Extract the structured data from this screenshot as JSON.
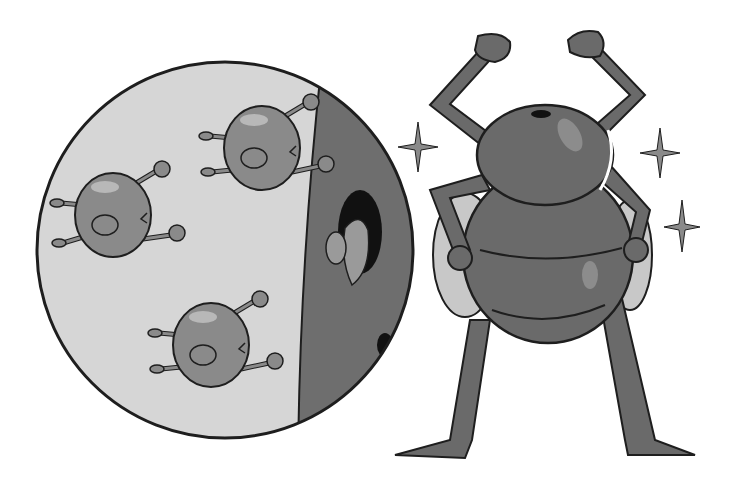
{
  "scene": {
    "description": "Grayscale cartoon illustration: magnified circle showing small germ-like bacteria beside a dark wall with a mushroom shape in a hole; a strong beetle/bug character flexing arms with sparkles",
    "background": "#ffffff",
    "colors": {
      "outline": "#1e1e1e",
      "circle_fill": "#d6d6d6",
      "wall_fill": "#6e6e6e",
      "germ_fill": "#8a8a8a",
      "germ_highlight": "#b8b8b8",
      "bug_body": "#6a6a6a",
      "bug_highlight": "#8c8c8c",
      "wing_fill": "#c8c8c8",
      "sparkle": "#8a8a8a"
    },
    "magnifier": {
      "cx": 225,
      "cy": 250,
      "r": 188
    },
    "germs": [
      {
        "cx": 113,
        "cy": 215,
        "rx": 38,
        "ry": 42
      },
      {
        "cx": 262,
        "cy": 148,
        "rx": 38,
        "ry": 42
      },
      {
        "cx": 211,
        "cy": 345,
        "rx": 38,
        "ry": 42
      }
    ],
    "sparkles": [
      {
        "x": 418,
        "y": 147,
        "size": 18
      },
      {
        "x": 660,
        "y": 153,
        "size": 18
      },
      {
        "x": 682,
        "y": 226,
        "size": 18
      }
    ]
  }
}
